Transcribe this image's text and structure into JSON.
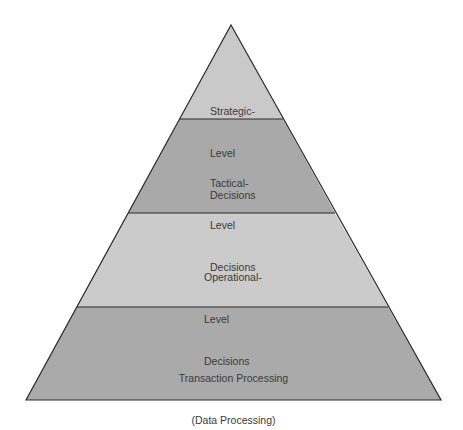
{
  "diagram": {
    "type": "pyramid",
    "levels": [
      {
        "id": "strategic",
        "lines": [
          "Strategic-",
          "Level",
          "Decisions"
        ],
        "fill": "#c9c9c9"
      },
      {
        "id": "tactical",
        "lines": [
          "Tactical-",
          "Level",
          "Decisions"
        ],
        "fill": "#a9a9a9"
      },
      {
        "id": "operational",
        "lines": [
          "Operational-",
          "Level",
          "Decisions"
        ],
        "fill": "#cbcbcb"
      },
      {
        "id": "transaction",
        "lines": [
          "Transaction Processing",
          "(Data Processing)"
        ],
        "fill": "#aaaaaa"
      }
    ],
    "outline_color": "#2a2a2a"
  }
}
